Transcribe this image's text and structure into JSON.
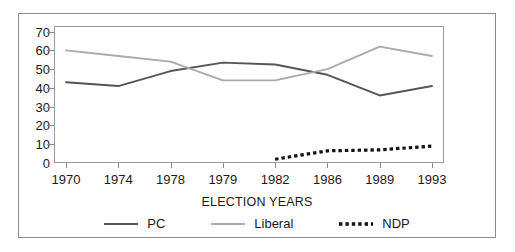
{
  "chart_data": {
    "type": "line",
    "title": "",
    "xlabel": "ELECTION YEARS",
    "ylabel": "",
    "categories": [
      "1970",
      "1974",
      "1978",
      "1979",
      "1982",
      "1986",
      "1989",
      "1993"
    ],
    "x_tick_labels": [
      "1970",
      "1974",
      "1978",
      "1979",
      "1982",
      "1986",
      "1989",
      "1993"
    ],
    "y_tick_labels": [
      "0",
      "10",
      "20",
      "30",
      "40",
      "50",
      "60",
      "70"
    ],
    "y_ticks": [
      0,
      10,
      20,
      30,
      40,
      50,
      60,
      70
    ],
    "ylim": [
      0,
      73
    ],
    "grid": false,
    "legend_position": "bottom",
    "series": [
      {
        "name": "PC",
        "style": "solid",
        "color": "#555555",
        "values": [
          43,
          41,
          49,
          53.5,
          52.5,
          47,
          36,
          41
        ]
      },
      {
        "name": "Liberal",
        "style": "solid",
        "color": "#aaaaaa",
        "values": [
          60,
          57,
          54,
          44,
          44,
          50,
          62,
          57
        ]
      },
      {
        "name": "NDP",
        "style": "dotted",
        "color": "#111111",
        "values": [
          null,
          null,
          null,
          null,
          2,
          6.5,
          7,
          9
        ]
      }
    ]
  },
  "axis": {
    "x_title": "ELECTION YEARS"
  },
  "legend": {
    "items": [
      {
        "label": "PC",
        "icon": "line-swatch-solid-dark"
      },
      {
        "label": "Liberal",
        "icon": "line-swatch-solid-light"
      },
      {
        "label": "NDP",
        "icon": "line-swatch-dotted-black"
      }
    ]
  }
}
